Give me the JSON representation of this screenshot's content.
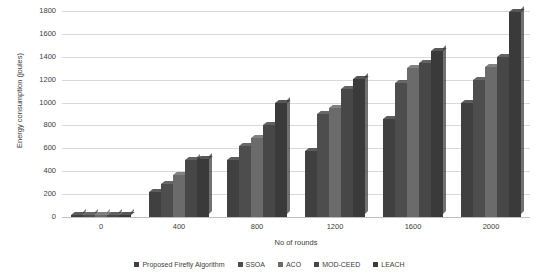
{
  "chart_data": {
    "type": "bar",
    "title": "",
    "xlabel": "No of rounds",
    "ylabel": "Energy consumption (joules)",
    "categories": [
      "0",
      "400",
      "800",
      "1200",
      "1600",
      "2000"
    ],
    "ylim": [
      0,
      1800
    ],
    "yticks": [
      0,
      200,
      400,
      600,
      800,
      1000,
      1200,
      1400,
      1600,
      1800
    ],
    "grid": true,
    "legend_position": "bottom",
    "series": [
      {
        "name": "Proposed Firefly Algorithm",
        "color": "#404040",
        "values": [
          0,
          220,
          495,
          580,
          860,
          1000
        ]
      },
      {
        "name": "SSOA",
        "color": "#4d4d4d",
        "values": [
          0,
          290,
          620,
          900,
          1170,
          1200
        ]
      },
      {
        "name": "ACO",
        "color": "#6b6b6b",
        "values": [
          0,
          370,
          690,
          950,
          1300,
          1310
        ]
      },
      {
        "name": "MOD-CEED",
        "color": "#474747",
        "values": [
          0,
          495,
          800,
          1120,
          1350,
          1400
        ]
      },
      {
        "name": "LEACH",
        "color": "#3a3a3a",
        "values": [
          0,
          505,
          1000,
          1210,
          1450,
          1790
        ]
      }
    ]
  },
  "axis": {
    "y_title": "Energy consumption (joules)",
    "x_title": "No of rounds",
    "y_tick_labels": [
      "1800",
      "1600",
      "1400",
      "1200",
      "1000",
      "800",
      "600",
      "400",
      "200",
      "0"
    ],
    "x_tick_labels": [
      "0",
      "400",
      "800",
      "1200",
      "1600",
      "2000"
    ]
  },
  "legend": {
    "items": [
      {
        "label": "Proposed Firefly Algorithm",
        "color": "#404040"
      },
      {
        "label": "SSOA",
        "color": "#4d4d4d"
      },
      {
        "label": "ACO",
        "color": "#6b6b6b"
      },
      {
        "label": "MOD-CEED",
        "color": "#474747"
      },
      {
        "label": "LEACH",
        "color": "#3a3a3a"
      }
    ]
  },
  "colors": {
    "grid": "#d9d9d9",
    "baseline": "#bfbfbf",
    "text": "#3d3d3d",
    "background": "#ffffff"
  }
}
